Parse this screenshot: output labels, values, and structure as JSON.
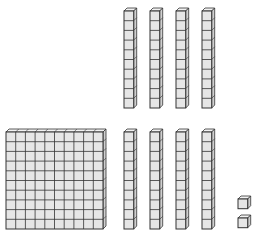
{
  "diagram": {
    "cell": 9.7,
    "colors": {
      "face": "#e6e6e6",
      "top": "#f2f2f2",
      "side": "#d0d0d0",
      "line": "#333333"
    },
    "hundreds": [
      {
        "x": 6,
        "y": 132,
        "cols": 10,
        "rows": 10
      }
    ],
    "tens": [
      {
        "x": 124,
        "y": 11,
        "rows": 10
      },
      {
        "x": 150,
        "y": 11,
        "rows": 10
      },
      {
        "x": 176,
        "y": 11,
        "rows": 10
      },
      {
        "x": 202,
        "y": 11,
        "rows": 10
      },
      {
        "x": 124,
        "y": 132,
        "rows": 10
      },
      {
        "x": 150,
        "y": 132,
        "rows": 10
      },
      {
        "x": 176,
        "y": 132,
        "rows": 10
      },
      {
        "x": 202,
        "y": 132,
        "rows": 10
      }
    ],
    "ones": [
      {
        "x": 238,
        "y": 199
      },
      {
        "x": 238,
        "y": 218
      }
    ],
    "counts": {
      "hundreds": 1,
      "tens": 8,
      "ones": 2
    },
    "value": 182
  }
}
